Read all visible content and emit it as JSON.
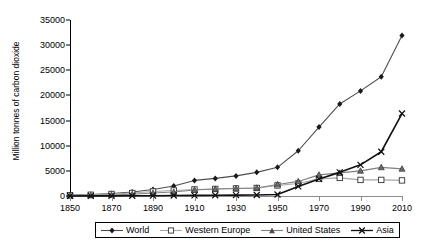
{
  "chart_data": {
    "type": "line",
    "title": "",
    "xlabel": "",
    "ylabel": "Million tonnes of carbon dioxide",
    "xlim": [
      1850,
      2010
    ],
    "ylim": [
      0,
      35000
    ],
    "grid": false,
    "legend_position": "bottom",
    "x": [
      1850,
      1860,
      1870,
      1880,
      1890,
      1900,
      1910,
      1920,
      1930,
      1940,
      1950,
      1960,
      1970,
      1980,
      1990,
      2000,
      2010
    ],
    "xticks": [
      "1850",
      "1870",
      "1890",
      "1910",
      "1930",
      "1950",
      "1970",
      "1990",
      "2010"
    ],
    "yticks": [
      "0",
      "5000",
      "10000",
      "15000",
      "20000",
      "25000",
      "30000",
      "35000"
    ],
    "series": [
      {
        "name": "World",
        "marker": "filled-diamond",
        "color": "#4d4d4d",
        "values": [
          200,
          300,
          500,
          800,
          1300,
          2000,
          3100,
          3500,
          4000,
          4700,
          5700,
          9000,
          13700,
          18300,
          20900,
          23700,
          31900
        ]
      },
      {
        "name": "Western Europe",
        "marker": "open-square",
        "color": "#a6a6a6",
        "values": [
          150,
          250,
          400,
          600,
          900,
          1100,
          1300,
          1400,
          1500,
          1600,
          2100,
          2500,
          3400,
          3600,
          3200,
          3200,
          3100
        ]
      },
      {
        "name": "United States",
        "marker": "filled-triangle",
        "color": "#808080",
        "values": [
          50,
          100,
          200,
          350,
          600,
          800,
          1200,
          1400,
          1500,
          1600,
          2300,
          2900,
          4200,
          4600,
          5000,
          5700,
          5400
        ]
      },
      {
        "name": "Asia",
        "marker": "cross-x",
        "color": "#111111",
        "values": [
          10,
          15,
          25,
          40,
          60,
          90,
          120,
          150,
          180,
          200,
          300,
          1900,
          3400,
          4700,
          6200,
          8800,
          16400
        ]
      }
    ]
  },
  "legend": {
    "items": [
      {
        "label": "World"
      },
      {
        "label": "Western Europe"
      },
      {
        "label": "United States"
      },
      {
        "label": "Asia"
      }
    ]
  }
}
